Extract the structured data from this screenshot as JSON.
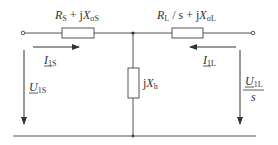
{
  "diagram": {
    "type": "equivalent-circuit",
    "stator_impedance": {
      "R": "R",
      "R_sub": "S",
      "plus_j": " + j",
      "X": "X",
      "X_sub": "σS"
    },
    "rotor_impedance": {
      "R": "R",
      "R_sub": "L",
      "slash_s": " / s + j",
      "X": "X",
      "X_sub": "σL"
    },
    "magnetizing": {
      "j": "j",
      "X": "X",
      "X_sub": "h"
    },
    "stator_current": {
      "I": "I",
      "sub": "1S"
    },
    "rotor_current": {
      "I": "I",
      "sub": "1L"
    },
    "stator_voltage": {
      "U": "U",
      "sub": "1S"
    },
    "rotor_voltage": {
      "U": "U",
      "sub": "1L",
      "denominator": "s"
    },
    "colors": {
      "wire": "#555555",
      "text": "#333333",
      "background": "#ffffff"
    }
  }
}
